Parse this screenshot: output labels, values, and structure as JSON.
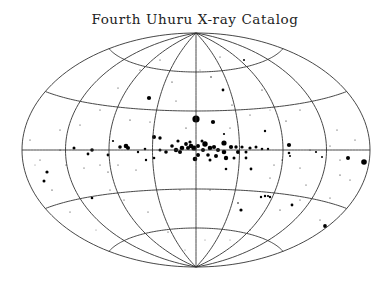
{
  "chart_data": {
    "type": "scatter",
    "title": "Fourth Uhuru X-ray Catalog",
    "projection": "aitoff",
    "coordinate_system": "galactic",
    "xlabel": "",
    "ylabel": "",
    "grid": true,
    "legend": null,
    "grid_meridians_deg": [
      -180,
      -135,
      -90,
      -45,
      0,
      45,
      90,
      135,
      180
    ],
    "grid_parallels_deg": [
      -60,
      -30,
      0,
      30,
      60
    ],
    "layout": {
      "center_px": [
        196,
        150
      ],
      "semi_axis_x_px": 174,
      "semi_axis_y_px": 117
    },
    "note": "Point sizes encode relative X-ray intensity; positions given in rendered pixel coordinates (x, y, radius).",
    "points": [
      [
        196,
        119,
        3.6
      ],
      [
        213,
        122,
        2.1
      ],
      [
        154,
        137,
        2.0
      ],
      [
        186,
        144,
        1.9
      ],
      [
        182,
        148,
        2.3
      ],
      [
        188,
        148,
        2.0
      ],
      [
        191,
        146,
        2.3
      ],
      [
        194,
        148,
        2.6
      ],
      [
        198,
        146,
        2.0
      ],
      [
        203,
        150,
        2.0
      ],
      [
        205,
        144,
        2.7
      ],
      [
        210,
        148,
        2.3
      ],
      [
        214,
        147,
        2.1
      ],
      [
        218,
        150,
        2.0
      ],
      [
        224,
        143,
        2.6
      ],
      [
        224,
        152,
        2.3
      ],
      [
        231,
        147,
        2.1
      ],
      [
        236,
        147,
        1.7
      ],
      [
        238,
        152,
        2.0
      ],
      [
        242,
        147,
        1.6
      ],
      [
        246,
        152,
        1.5
      ],
      [
        250,
        148,
        1.6
      ],
      [
        256,
        147,
        1.5
      ],
      [
        262,
        149,
        1.3
      ],
      [
        268,
        149,
        1.2
      ],
      [
        176,
        150,
        2.2
      ],
      [
        180,
        152,
        2.0
      ],
      [
        172,
        146,
        1.8
      ],
      [
        166,
        152,
        1.8
      ],
      [
        160,
        150,
        1.5
      ],
      [
        198,
        155,
        2.0
      ],
      [
        195,
        159,
        2.3
      ],
      [
        208,
        155,
        1.8
      ],
      [
        216,
        156,
        2.0
      ],
      [
        226,
        158,
        2.2
      ],
      [
        234,
        158,
        1.5
      ],
      [
        246,
        158,
        1.4
      ],
      [
        210,
        160,
        1.5
      ],
      [
        190,
        142,
        1.6
      ],
      [
        202,
        141,
        1.5
      ],
      [
        178,
        141,
        1.6
      ],
      [
        126,
        146,
        2.3
      ],
      [
        128,
        148,
        2.0
      ],
      [
        120,
        147,
        1.8
      ],
      [
        92,
        150,
        1.8
      ],
      [
        74,
        148,
        1.5
      ],
      [
        88,
        154,
        1.4
      ],
      [
        108,
        155,
        1.4
      ],
      [
        138,
        152,
        1.2
      ],
      [
        145,
        149,
        1.3
      ],
      [
        160,
        138,
        1.7
      ],
      [
        154,
        158,
        1.3
      ],
      [
        146,
        160,
        1.2
      ],
      [
        289,
        145,
        2.1
      ],
      [
        289,
        153,
        1.3
      ],
      [
        290,
        156,
        1.0
      ],
      [
        364,
        162,
        2.8
      ],
      [
        348,
        158,
        2.0
      ],
      [
        316,
        152,
        1.1
      ],
      [
        322,
        157,
        1.0
      ],
      [
        47,
        172,
        1.6
      ],
      [
        44,
        181,
        1.5
      ],
      [
        92,
        198,
        1.3
      ],
      [
        113,
        141,
        1.1
      ],
      [
        149,
        98,
        2.1
      ],
      [
        223,
        90,
        1.4
      ],
      [
        224,
        134,
        1.1
      ],
      [
        265,
        131,
        1.2
      ],
      [
        261,
        197,
        1.2
      ],
      [
        265,
        196,
        1.2
      ],
      [
        268,
        196,
        1.1
      ],
      [
        270,
        197,
        1.2
      ],
      [
        292,
        205,
        1.4
      ],
      [
        241,
        210,
        1.6
      ],
      [
        325,
        226,
        1.9
      ],
      [
        251,
        169,
        1.4
      ],
      [
        226,
        169,
        1.3
      ],
      [
        238,
        203,
        0.8
      ],
      [
        244,
        60,
        1.0
      ],
      [
        211,
        77,
        0.7
      ],
      [
        232,
        105,
        0.6
      ],
      [
        262,
        90,
        0.6
      ],
      [
        286,
        121,
        0.6
      ],
      [
        300,
        110,
        0.5
      ],
      [
        337,
        130,
        0.5
      ],
      [
        340,
        175,
        0.6
      ],
      [
        350,
        180,
        0.5
      ],
      [
        355,
        140,
        0.5
      ],
      [
        270,
        178,
        0.5
      ],
      [
        280,
        210,
        0.6
      ],
      [
        300,
        200,
        0.5
      ],
      [
        320,
        220,
        0.5
      ],
      [
        306,
        185,
        0.5
      ],
      [
        330,
        198,
        0.5
      ],
      [
        60,
        150,
        0.6
      ],
      [
        40,
        160,
        0.5
      ],
      [
        52,
        190,
        0.6
      ],
      [
        70,
        212,
        0.5
      ],
      [
        110,
        190,
        0.5
      ],
      [
        108,
        172,
        0.6
      ],
      [
        124,
        200,
        0.5
      ],
      [
        136,
        170,
        0.5
      ],
      [
        148,
        212,
        0.5
      ],
      [
        168,
        232,
        0.5
      ],
      [
        130,
        120,
        0.6
      ],
      [
        100,
        110,
        0.5
      ],
      [
        80,
        125,
        0.5
      ],
      [
        60,
        130,
        0.5
      ],
      [
        118,
        88,
        0.5
      ],
      [
        140,
        70,
        0.5
      ],
      [
        160,
        60,
        0.5
      ],
      [
        172,
        82,
        0.6
      ],
      [
        150,
        122,
        0.5
      ],
      [
        180,
        190,
        0.5
      ],
      [
        210,
        190,
        0.5
      ],
      [
        205,
        240,
        0.4
      ],
      [
        185,
        250,
        0.4
      ],
      [
        230,
        240,
        0.4
      ],
      [
        250,
        230,
        0.5
      ],
      [
        96,
        230,
        0.4
      ],
      [
        220,
        57,
        0.5
      ],
      [
        200,
        70,
        0.4
      ],
      [
        176,
        101,
        0.5
      ],
      [
        186,
        128,
        0.6
      ],
      [
        230,
        128,
        0.5
      ],
      [
        250,
        115,
        0.5
      ],
      [
        270,
        110,
        0.4
      ],
      [
        282,
        160,
        0.6
      ],
      [
        274,
        165,
        0.5
      ],
      [
        300,
        168,
        0.5
      ],
      [
        310,
        150,
        0.6
      ],
      [
        330,
        146,
        0.5
      ],
      [
        340,
        160,
        0.5
      ],
      [
        30,
        140,
        0.5
      ],
      [
        35,
        165,
        0.4
      ],
      [
        66,
        165,
        0.5
      ],
      [
        84,
        168,
        0.5
      ],
      [
        100,
        165,
        0.5
      ],
      [
        118,
        165,
        0.5
      ]
    ]
  }
}
